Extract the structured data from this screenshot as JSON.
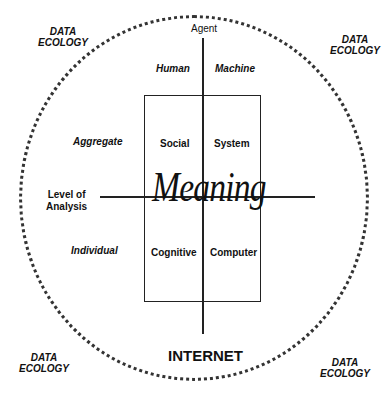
{
  "diagram": {
    "boundary_label": "INTERNET",
    "corner_labels": [
      {
        "line1": "DATA",
        "line2": "ECOLOGY",
        "position": "top-left"
      },
      {
        "line1": "DATA",
        "line2": "ECOLOGY",
        "position": "top-right"
      },
      {
        "line1": "DATA",
        "line2": "ECOLOGY",
        "position": "bottom-left"
      },
      {
        "line1": "DATA",
        "line2": "ECOLOGY",
        "position": "bottom-right"
      }
    ],
    "axes": {
      "vertical": {
        "title": "Agent",
        "left": "Human",
        "right": "Machine"
      },
      "horizontal": {
        "title_line1": "Level of",
        "title_line2": "Analysis",
        "top": "Aggregate",
        "bottom": "Individual"
      }
    },
    "quadrants": {
      "top_left": "Social",
      "top_right": "System",
      "bottom_left": "Cognitive",
      "bottom_right": "Computer"
    },
    "center_label": "Meaning"
  }
}
